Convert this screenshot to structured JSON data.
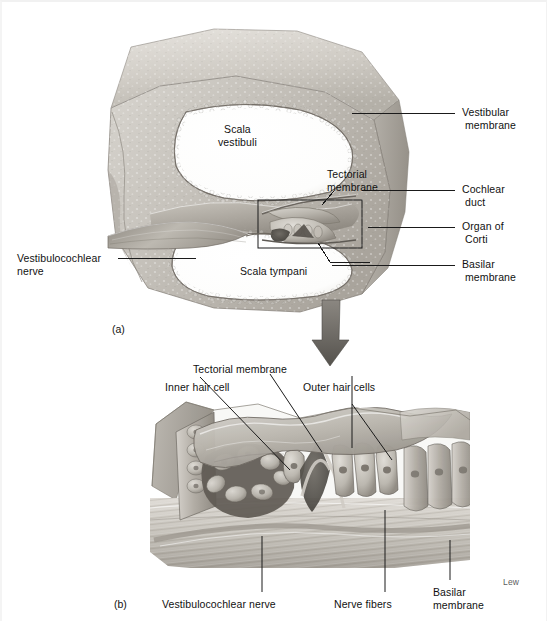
{
  "figure": {
    "signature": "Lew",
    "colors": {
      "background": "#ffffff",
      "ink": "#111111",
      "leader_line": "#1a1a1a",
      "arrow": "#6e6e6e",
      "tissue_light": "#dcd9d4",
      "tissue_mid": "#b3afa8",
      "tissue_dark": "#8c877f",
      "tissue_darker": "#6d6962",
      "lumen": "#ffffff"
    }
  },
  "panel_a": {
    "id": "(a)",
    "labels": {
      "vestibular_membrane": {
        "line1": "Vestibular",
        "line2": "membrane"
      },
      "cochlear_duct": {
        "line1": "Cochlear",
        "line2": "duct"
      },
      "organ_of_corti": {
        "line1": "Organ of",
        "line2": "Corti"
      },
      "basilar_membrane": {
        "line1": "Basilar",
        "line2": "membrane"
      },
      "scala_vestibuli": {
        "line1": "Scala",
        "line2": "vestibuli"
      },
      "scala_tympani": {
        "line1": "Scala tympani"
      },
      "tectorial_membrane": {
        "line1": "Tectorial",
        "line2": "membrane"
      },
      "vestibulocochlear_nerve": {
        "line1": "Vestibulocochlear",
        "line2": "nerve"
      }
    }
  },
  "panel_b": {
    "id": "(b)",
    "labels": {
      "tectorial_membrane": {
        "line1": "Tectorial membrane"
      },
      "inner_hair_cell": {
        "line1": "Inner hair cell"
      },
      "outer_hair_cells": {
        "line1": "Outer hair cells"
      },
      "vestibulocochlear_nerve": {
        "line1": "Vestibulocochlear nerve"
      },
      "nerve_fibers": {
        "line1": "Nerve fibers"
      },
      "basilar_membrane": {
        "line1": "Basilar",
        "line2": "membrane"
      }
    }
  }
}
